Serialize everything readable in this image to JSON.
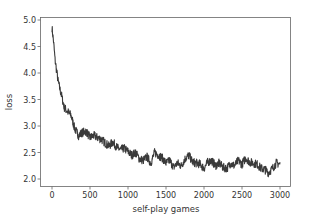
{
  "chart_data": {
    "type": "line",
    "title": "",
    "xlabel": "self-play games",
    "ylabel": "loss",
    "xlim": [
      -150,
      3150
    ],
    "ylim": [
      1.87,
      5.05
    ],
    "xticks": [
      0,
      500,
      1000,
      1500,
      2000,
      2500,
      3000
    ],
    "xtick_labels": [
      "0",
      "500",
      "1000",
      "1500",
      "2000",
      "2500",
      "3000"
    ],
    "yticks": [
      2.0,
      2.5,
      3.0,
      3.5,
      4.0,
      4.5,
      5.0
    ],
    "ytick_labels": [
      "2.0",
      "2.5",
      "3.0",
      "3.5",
      "4.0",
      "4.5",
      "5.0"
    ],
    "grid": false,
    "legend": null,
    "series": [
      {
        "name": "loss",
        "color": "#3a3a3a",
        "x": [
          0,
          20,
          40,
          60,
          80,
          100,
          130,
          160,
          200,
          250,
          300,
          350,
          400,
          450,
          500,
          550,
          600,
          650,
          700,
          750,
          800,
          850,
          900,
          950,
          1000,
          1050,
          1100,
          1150,
          1200,
          1250,
          1300,
          1350,
          1400,
          1450,
          1500,
          1550,
          1600,
          1650,
          1700,
          1750,
          1800,
          1850,
          1900,
          1950,
          2000,
          2050,
          2100,
          2150,
          2200,
          2250,
          2300,
          2350,
          2400,
          2450,
          2500,
          2550,
          2600,
          2650,
          2700,
          2750,
          2800,
          2850,
          2900,
          2950,
          3000
        ],
        "y": [
          4.85,
          4.6,
          4.25,
          4.05,
          3.85,
          3.72,
          3.55,
          3.35,
          3.28,
          3.2,
          2.95,
          2.82,
          2.88,
          2.9,
          2.78,
          2.82,
          2.78,
          2.75,
          2.68,
          2.62,
          2.7,
          2.6,
          2.55,
          2.58,
          2.52,
          2.45,
          2.5,
          2.38,
          2.35,
          2.42,
          2.3,
          2.5,
          2.45,
          2.4,
          2.3,
          2.35,
          2.22,
          2.3,
          2.25,
          2.38,
          2.45,
          2.32,
          2.3,
          2.28,
          2.2,
          2.32,
          2.35,
          2.25,
          2.3,
          2.22,
          2.2,
          2.3,
          2.25,
          2.35,
          2.28,
          2.4,
          2.32,
          2.3,
          2.28,
          2.2,
          2.18,
          2.12,
          2.2,
          2.3,
          2.28
        ]
      }
    ]
  },
  "colors": {
    "line": "#3a3a3a",
    "axes": "#555555",
    "text": "#333333",
    "background": "#ffffff"
  }
}
